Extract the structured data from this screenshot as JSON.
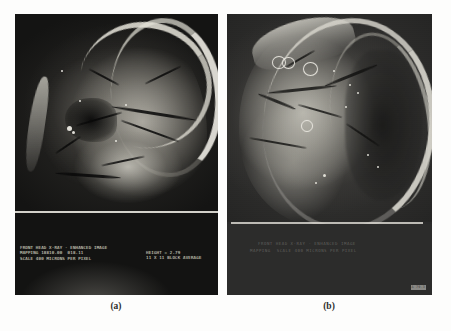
{
  "figure": {
    "kind": "two-panel-radiograph-figure",
    "background_color": "#fdfdfc"
  },
  "panels": [
    {
      "id": "a",
      "caption": "(a)",
      "background_color": "#111111",
      "description": "front head X-ray enhanced image with CRT annotation block",
      "annotations": {
        "left_block": "FRONT HEAD X-RAY - ENHANCED IMAGE\nMAPPING 18810.00  018.11\nSCALE 400 MICRONS PER PIXEL",
        "right_block": "HEIGHT = 2.79\n11 X 11 BLOCK AVERAGE",
        "text_color": "#e2e2d6"
      }
    },
    {
      "id": "b",
      "caption": "(b)",
      "background_color": "#2a2a2a",
      "description": "side head X-ray enhanced image with circular region markers",
      "annotations": {
        "faint_line_1": "FRONT HEAD X-RAY - ENHANCED IMAGE",
        "faint_line_2": "MAPPING  SCALE 400 MICRONS PER PIXEL",
        "corner_tag": "A 79-3",
        "text_color": "#969590"
      },
      "markers": {
        "ring_count": 4,
        "ring_color": "#eeeae4"
      }
    }
  ]
}
